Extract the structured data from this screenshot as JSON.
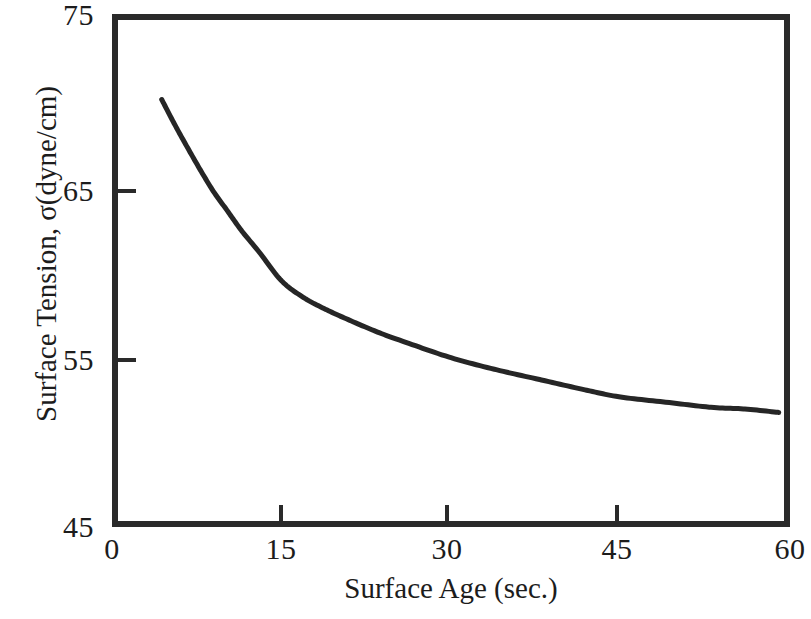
{
  "chart_data": {
    "type": "line",
    "title": "",
    "xlabel": "Surface Age (sec.)",
    "ylabel": "Surface Tension, σ(dyne/cm)",
    "xlim": [
      0,
      60
    ],
    "ylim": [
      45,
      75
    ],
    "xticks": [
      0,
      15,
      30,
      45,
      60
    ],
    "xtick_labels": [
      "0",
      "15",
      "30",
      "45",
      "60"
    ],
    "yticks": [
      45,
      55,
      65,
      75
    ],
    "ytick_labels": [
      "45",
      "55",
      "65",
      "75"
    ],
    "grid": false,
    "legend": null,
    "series": [
      {
        "name": "dynamic surface tension",
        "color": "#262626",
        "x": [
          4.4,
          5.5,
          6.5,
          7.8,
          9.0,
          10.2,
          11.5,
          13.0,
          15.0,
          17.0,
          19.0,
          21.0,
          23.5,
          26.0,
          30.0,
          34.0,
          38.0,
          42.0,
          45.0,
          49.0,
          53.0,
          56.0,
          59.0
        ],
        "y": [
          70.0,
          68.6,
          67.4,
          65.9,
          64.6,
          63.5,
          62.3,
          61.1,
          59.4,
          58.4,
          57.7,
          57.1,
          56.4,
          55.8,
          54.9,
          54.2,
          53.6,
          53.0,
          52.6,
          52.3,
          52.0,
          51.9,
          51.7
        ]
      }
    ]
  },
  "axes": {
    "x_label": "Surface Age (sec.)",
    "y_label": "Surface Tension, σ(dyne/cm)",
    "x_tick_labels": [
      "0",
      "15",
      "30",
      "45",
      "60"
    ],
    "y_tick_labels": [
      "75",
      "65",
      "55",
      "45"
    ]
  },
  "style": {
    "frame_color": "#2a2a2a",
    "curve_color": "#262626",
    "background": "#ffffff"
  }
}
